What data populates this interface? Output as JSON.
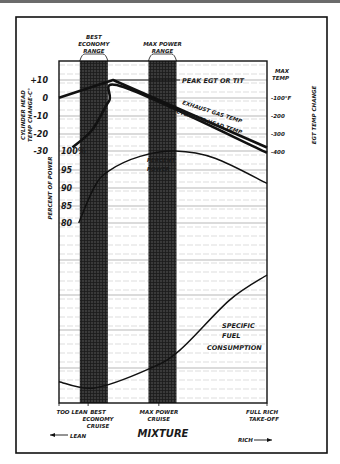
{
  "chart_data": {
    "type": "line",
    "title": "",
    "xlabel": "MIXTURE",
    "x_direction_labels": {
      "left": "LEAN",
      "right": "RICH"
    },
    "x_range": [
      0,
      100
    ],
    "x_ticks": [
      {
        "x": 0,
        "label": [
          "TOO LEAN"
        ]
      },
      {
        "x": 14,
        "label": [
          "BEST",
          "ECONOMY",
          "CRUISE"
        ]
      },
      {
        "x": 48,
        "label": [
          "MAX POWER",
          "CRUISE"
        ]
      },
      {
        "x": 100,
        "label": [
          "FULL RICH",
          "TAKE-OFF"
        ]
      }
    ],
    "bands": [
      {
        "name": "BEST ECONOMY RANGE",
        "label": [
          "BEST",
          "ECONOMY",
          "RANGE"
        ],
        "x_range": [
          10,
          23.5
        ]
      },
      {
        "name": "MAX POWER RANGE",
        "label": [
          "MAX POWER",
          "RANGE"
        ],
        "x_range": [
          43,
          56.5
        ]
      }
    ],
    "axes": {
      "left_top": {
        "label": [
          "CYLINDER HEAD",
          "TEMP CHANGE-C°"
        ],
        "ticks": [
          "+10",
          "0",
          "-10",
          "-20",
          "-30"
        ],
        "range": [
          -30,
          10
        ]
      },
      "left_bottom": {
        "label": [
          "PERCENT OF POWER"
        ],
        "ticks": [
          "100%",
          "95",
          "90",
          "85",
          "80"
        ],
        "range": [
          80,
          100
        ]
      },
      "right": {
        "label": [
          "EGT TEMP CHANGE"
        ],
        "ticks": [
          "MAX TEMP",
          "-100°F",
          "-200",
          "-300",
          "-400"
        ],
        "range": [
          -400,
          0
        ]
      }
    },
    "series": [
      {
        "name": "Exhaust Gas Temp",
        "label": "EXHAUST GAS TEMP",
        "axis": "right",
        "x": [
          0,
          26,
          100
        ],
        "y": [
          -100,
          0,
          -380
        ]
      },
      {
        "name": "Cylinder Head Temp",
        "label": "CYLINDER HEAD TEMP",
        "axis": "left_top",
        "x": [
          6.5,
          16,
          24,
          31,
          100
        ],
        "y": [
          -28,
          -18,
          -2,
          6,
          -31
        ]
      },
      {
        "name": "Percent Power",
        "label": "PERCENT POWER",
        "axis": "left_bottom",
        "x": [
          9.5,
          17,
          24,
          39,
          56,
          75,
          100
        ],
        "y": [
          80,
          90,
          94.5,
          98.5,
          100,
          98,
          91
        ]
      },
      {
        "name": "Specific Fuel Consumption",
        "label": "SPECIFIC FUEL CONSUMPTION",
        "axis": "sfc",
        "x": [
          0,
          17,
          43,
          58,
          82,
          100
        ],
        "y": [
          0.15,
          0.1,
          0.25,
          0.4,
          0.8,
          1.0
        ]
      }
    ],
    "annotations": [
      {
        "text": "PEAK EGT OR TIT",
        "x": 26,
        "axis": "right",
        "y": 0
      }
    ],
    "grid": true
  }
}
